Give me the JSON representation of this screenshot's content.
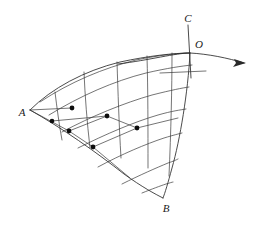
{
  "figure": {
    "width": 258,
    "height": 230,
    "background_color": "#ffffff",
    "line_color": "#2a2a2a",
    "mesh_color": "#3a3a3a",
    "dot_color": "#0d0d0d"
  },
  "labels": [
    {
      "id": "A",
      "text": "A",
      "x": 22,
      "y": 116,
      "anchor": "middle"
    },
    {
      "id": "B",
      "text": "B",
      "x": 166,
      "y": 212,
      "anchor": "middle"
    },
    {
      "id": "C",
      "text": "C",
      "x": 188,
      "y": 22,
      "anchor": "middle"
    },
    {
      "id": "O",
      "text": "O",
      "x": 199,
      "y": 48,
      "anchor": "middle"
    }
  ],
  "vertices": {
    "A": {
      "x": 30,
      "y": 110
    },
    "B": {
      "x": 163,
      "y": 198
    },
    "O": {
      "x": 190,
      "y": 53
    }
  },
  "axis": {
    "name": "vertical-axis-OC",
    "from": {
      "x": 188,
      "y": 25
    },
    "to": {
      "x": 191,
      "y": 78
    }
  },
  "arrow": {
    "name": "horizontal-arrow-from-O",
    "path": "M 118 64 C 150 60 176 53 190 53 C 208 54 228 58 244 63",
    "tip": {
      "x": 246,
      "y": 63
    },
    "head_points": "246,63 234,59 236,63 233,67"
  },
  "extra_chord": {
    "name": "interior-chord",
    "from": {
      "x": 160,
      "y": 73
    },
    "to": {
      "x": 206,
      "y": 71
    }
  },
  "boundaries": [
    {
      "name": "arc-A-to-O-top",
      "path": "M 30 110 C 52 88 84 71 120 62 C 148 56 174 53 190 53"
    },
    {
      "name": "arc-A-to-B-bottom",
      "path": "M 30 110 C 62 128 96 152 124 174 C 142 187 155 194 163 198"
    },
    {
      "name": "arc-O-to-B-right",
      "path": "M 190 53 C 188 92 180 140 172 168 C 168 183 165 193 163 198"
    }
  ],
  "radial_curves": [
    {
      "name": "radial-1",
      "path": "M 55 92 C 57 108 59 124 62 140"
    },
    {
      "name": "radial-2",
      "path": "M 84 72 C 85 96 87 122 90 148"
    },
    {
      "name": "radial-3",
      "path": "M 117 62 C 118 92 119 124 121 158"
    },
    {
      "name": "radial-4",
      "path": "M 147 56 C 148 90 148 128 148 168"
    },
    {
      "name": "radial-5",
      "path": "M 172 53 C 172 88 171 130 169 176"
    }
  ],
  "arc_curves": [
    {
      "name": "arc-level-1",
      "path": "M 40 102 C 70 82 104 68 136 60 C 160 55 180 53 190 53"
    },
    {
      "name": "arc-level-2",
      "path": "M 49 115 C 80 96 114 81 146 73 C 168 68 182 66 192 65"
    },
    {
      "name": "arc-level-3",
      "path": "M 62 132 C 92 116 124 103 152 95 C 172 90 182 88 189 87"
    },
    {
      "name": "arc-level-4",
      "path": "M 78 148 C 106 134 134 122 158 115 C 172 111 180 110 186 109"
    },
    {
      "name": "arc-level-5",
      "path": "M 98 167 C 122 154 146 144 164 138 C 174 135 178 134 182 133"
    },
    {
      "name": "arc-level-6",
      "path": "M 122 184 C 140 175 156 168 168 163 C 174 161 176 160 178 159"
    },
    {
      "name": "arc-level-7",
      "path": "M 142 193 C 152 189 160 186 166 184 C 170 183 172 182 173 182"
    }
  ],
  "chords": [
    {
      "name": "chord-A-to-n2",
      "from": {
        "x": 30,
        "y": 110
      },
      "to": {
        "x": 72,
        "y": 108
      }
    },
    {
      "name": "chord-A-to-n3",
      "from": {
        "x": 30,
        "y": 110
      },
      "to": {
        "x": 69,
        "y": 131
      }
    },
    {
      "name": "chord-n1-to-n4",
      "from": {
        "x": 52,
        "y": 121
      },
      "to": {
        "x": 107,
        "y": 116
      }
    },
    {
      "name": "chord-n3-to-n4",
      "from": {
        "x": 69,
        "y": 131
      },
      "to": {
        "x": 107,
        "y": 116
      }
    },
    {
      "name": "chord-n3-to-n5",
      "from": {
        "x": 69,
        "y": 131
      },
      "to": {
        "x": 93,
        "y": 147
      }
    },
    {
      "name": "chord-n4-to-n6",
      "from": {
        "x": 107,
        "y": 116
      },
      "to": {
        "x": 137,
        "y": 128
      }
    },
    {
      "name": "chord-n5-to-n6",
      "from": {
        "x": 93,
        "y": 147
      },
      "to": {
        "x": 137,
        "y": 128
      }
    },
    {
      "name": "chord-n6-right",
      "from": {
        "x": 137,
        "y": 128
      },
      "to": {
        "x": 178,
        "y": 118
      }
    },
    {
      "name": "chord-n5-down",
      "from": {
        "x": 93,
        "y": 147
      },
      "to": {
        "x": 130,
        "y": 178
      }
    }
  ],
  "nodes": [
    {
      "name": "node-1",
      "x": 52,
      "y": 121,
      "r": 2.3
    },
    {
      "name": "node-2",
      "x": 72,
      "y": 108,
      "r": 2.4
    },
    {
      "name": "node-3",
      "x": 69,
      "y": 131,
      "r": 2.4
    },
    {
      "name": "node-4",
      "x": 107,
      "y": 116,
      "r": 2.4
    },
    {
      "name": "node-5",
      "x": 93,
      "y": 147,
      "r": 2.4
    },
    {
      "name": "node-6",
      "x": 137,
      "y": 128,
      "r": 2.4
    }
  ]
}
